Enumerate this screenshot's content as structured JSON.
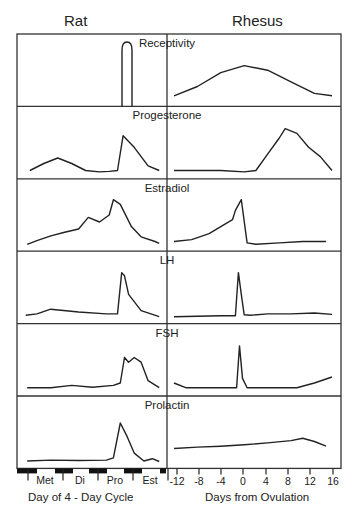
{
  "header": {
    "left_title": "Rat",
    "right_title": "Rhesus"
  },
  "panels": [
    "Receptivity",
    "Progesterone",
    "Estradiol",
    "LH",
    "FSH",
    "Prolactin"
  ],
  "x_axis": {
    "left_title": "Day of 4 - Day Cycle",
    "left_ticks": [
      "Met",
      "Di",
      "Pro",
      "Est"
    ],
    "right_title": "Days from Ovulation",
    "right_ticks": [
      "-12",
      "-8",
      "-4",
      "0",
      "4",
      "8",
      "12",
      "16"
    ]
  },
  "chart_data": {
    "type": "line",
    "title": "",
    "columns": [
      "Rat",
      "Rhesus"
    ],
    "rows": [
      "Receptivity",
      "Progesterone",
      "Estradiol",
      "LH",
      "FSH",
      "Prolactin"
    ],
    "rat": {
      "xlabel": "Day of 4 - Day Cycle",
      "categories": [
        "Met",
        "Di",
        "Pro",
        "Est"
      ],
      "note": "relative levels, 0-1 scale, x in fraction of 4-day cycle",
      "series": [
        {
          "name": "Receptivity",
          "x": [
            0,
            0.72,
            0.74,
            0.78,
            0.8,
            1
          ],
          "values": [
            0,
            0,
            1,
            1,
            0,
            0
          ]
        },
        {
          "name": "Progesterone",
          "x": [
            0.05,
            0.15,
            0.25,
            0.35,
            0.45,
            0.55,
            0.62,
            0.68,
            0.72,
            0.8,
            0.9,
            0.98
          ],
          "values": [
            0.05,
            0.2,
            0.32,
            0.2,
            0.05,
            0.02,
            0.03,
            0.05,
            0.8,
            0.55,
            0.15,
            0.05
          ]
        },
        {
          "name": "Estradiol",
          "x": [
            0.03,
            0.1,
            0.2,
            0.3,
            0.4,
            0.47,
            0.55,
            0.62,
            0.65,
            0.7,
            0.78,
            0.85,
            0.95,
            0.98
          ],
          "values": [
            0.02,
            0.1,
            0.2,
            0.28,
            0.35,
            0.6,
            0.5,
            0.65,
            0.98,
            0.88,
            0.4,
            0.18,
            0.08,
            0.04
          ]
        },
        {
          "name": "LH",
          "x": [
            0.02,
            0.1,
            0.2,
            0.4,
            0.6,
            0.68,
            0.71,
            0.73,
            0.76,
            0.85,
            0.98
          ],
          "values": [
            0.05,
            0.08,
            0.18,
            0.12,
            0.08,
            0.08,
            0.97,
            0.9,
            0.5,
            0.15,
            0.02
          ]
        },
        {
          "name": "FSH",
          "x": [
            0.03,
            0.2,
            0.35,
            0.5,
            0.65,
            0.7,
            0.73,
            0.76,
            0.8,
            0.85,
            0.9,
            0.98
          ],
          "values": [
            0.05,
            0.05,
            0.1,
            0.06,
            0.1,
            0.15,
            0.7,
            0.6,
            0.7,
            0.6,
            0.2,
            0.05
          ]
        },
        {
          "name": "Prolactin",
          "x": [
            0.03,
            0.2,
            0.4,
            0.6,
            0.65,
            0.7,
            0.75,
            0.8,
            0.87,
            0.93,
            0.98
          ],
          "values": [
            0.03,
            0.05,
            0.04,
            0.05,
            0.1,
            0.85,
            0.55,
            0.2,
            0.03,
            0.08,
            0.02
          ]
        }
      ]
    },
    "rhesus": {
      "xlabel": "Days from Ovulation",
      "x_ticks": [
        -12,
        -8,
        -4,
        0,
        4,
        8,
        12,
        16
      ],
      "xlim": [
        -13,
        16
      ],
      "note": "relative levels, 0-1 scale",
      "series": [
        {
          "name": "Receptivity",
          "x": [
            -12,
            -8,
            -4,
            0,
            4,
            8,
            12,
            15
          ],
          "values": [
            0.1,
            0.3,
            0.6,
            0.75,
            0.65,
            0.4,
            0.15,
            0.1
          ]
        },
        {
          "name": "Progesterone",
          "x": [
            -12,
            -8,
            -4,
            0,
            2,
            4,
            6,
            7,
            9,
            11,
            13,
            15
          ],
          "values": [
            0.05,
            0.05,
            0.05,
            0.02,
            0.05,
            0.4,
            0.75,
            0.95,
            0.85,
            0.55,
            0.35,
            0.05
          ]
        },
        {
          "name": "Estradiol",
          "x": [
            -12,
            -9,
            -6,
            -4,
            -2,
            -1.5,
            -0.5,
            0.5,
            2,
            6,
            10,
            14
          ],
          "values": [
            0.08,
            0.12,
            0.25,
            0.4,
            0.55,
            0.75,
            0.98,
            0.05,
            0.02,
            0.05,
            0.08,
            0.08
          ]
        },
        {
          "name": "LH",
          "x": [
            -12,
            -8,
            -4,
            -1.5,
            -1,
            -0.5,
            0,
            1,
            4,
            8,
            12,
            15
          ],
          "values": [
            0.02,
            0.03,
            0.04,
            0.04,
            0.97,
            0.5,
            0.06,
            0.05,
            0.08,
            0.08,
            0.1,
            0.07
          ]
        },
        {
          "name": "FSH",
          "x": [
            -12,
            -10,
            -6,
            -2,
            -1.3,
            -0.8,
            -0.3,
            0.5,
            4,
            9,
            12,
            15
          ],
          "values": [
            0.15,
            0.05,
            0.05,
            0.05,
            0.05,
            0.95,
            0.25,
            0.05,
            0.05,
            0.05,
            0.15,
            0.28
          ]
        },
        {
          "name": "Prolactin",
          "x": [
            -12,
            -8,
            -4,
            0,
            4,
            8,
            10,
            12,
            14
          ],
          "values": [
            0.3,
            0.33,
            0.35,
            0.38,
            0.42,
            0.47,
            0.52,
            0.45,
            0.35
          ]
        }
      ]
    }
  }
}
